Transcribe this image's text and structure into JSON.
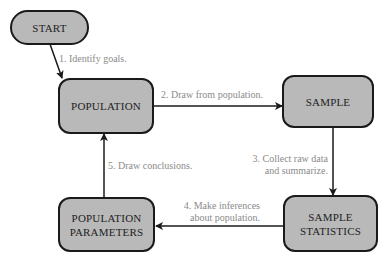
{
  "nodes": {
    "start": "START",
    "population": "POPULATION",
    "sample": "SAMPLE",
    "sample_statistics_1": "SAMPLE",
    "sample_statistics_2": "STATISTICS",
    "population_parameters_1": "POPULATION",
    "population_parameters_2": "PARAMETERS"
  },
  "steps": {
    "s1": "1. Identify goals.",
    "s2": "2. Draw from population.",
    "s3_1": "3. Collect raw data",
    "s3_2": "and summarize.",
    "s4_1": "4. Make inferences",
    "s4_2": "about population.",
    "s5": "5. Draw conclusions."
  },
  "colors": {
    "box_fill": "#b9b9b9",
    "border": "#1a1a1a",
    "label_text": "#8a8a8a"
  }
}
